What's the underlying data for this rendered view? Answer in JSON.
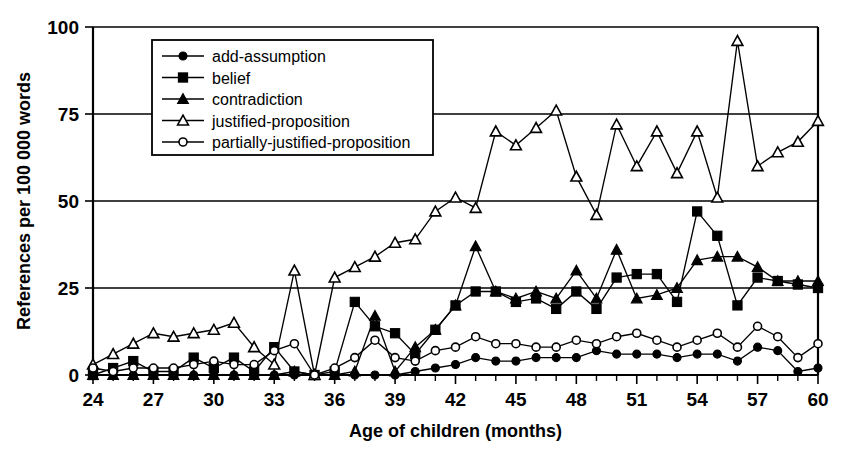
{
  "chart_data": {
    "type": "line",
    "title": "",
    "xlabel": "Age of children (months)",
    "ylabel": "References per 100 000 words",
    "xlim": [
      24,
      60
    ],
    "ylim": [
      0,
      100
    ],
    "yticks": [
      0,
      25,
      50,
      75,
      100
    ],
    "xticks": [
      24,
      27,
      30,
      33,
      36,
      39,
      42,
      45,
      48,
      51,
      54,
      57,
      60
    ],
    "xtick_labels": [
      "24",
      "27",
      "30",
      "33",
      "36",
      "39",
      "42",
      "45",
      "48",
      "51",
      "54",
      "57",
      "60"
    ],
    "ytick_labels": [
      "0",
      "25",
      "50",
      "75",
      "100"
    ],
    "x_minor_step": 1,
    "grid": "horizontal",
    "legend_position": "top-left-inside",
    "x": [
      24,
      25,
      26,
      27,
      28,
      29,
      30,
      31,
      32,
      33,
      34,
      35,
      36,
      37,
      38,
      39,
      40,
      41,
      42,
      43,
      44,
      45,
      46,
      47,
      48,
      49,
      50,
      51,
      52,
      53,
      54,
      55,
      56,
      57,
      58,
      59,
      60
    ],
    "series": [
      {
        "name": "add-assumption",
        "marker": "filled-circle",
        "values": [
          0,
          0,
          0,
          0,
          0,
          0,
          0,
          0,
          0,
          0,
          0,
          0,
          0,
          0,
          0,
          0,
          1,
          2,
          3,
          5,
          4,
          4,
          5,
          5,
          5,
          7,
          6,
          6,
          6,
          5,
          6,
          6,
          4,
          8,
          7,
          1,
          2
        ]
      },
      {
        "name": "belief",
        "marker": "filled-square",
        "values": [
          0,
          2,
          4,
          1,
          1,
          5,
          2,
          5,
          1,
          8,
          1,
          0,
          1,
          21,
          14,
          12,
          6,
          13,
          20,
          24,
          24,
          21,
          22,
          19,
          24,
          19,
          28,
          29,
          29,
          21,
          47,
          40,
          20,
          28,
          27,
          26,
          25
        ]
      },
      {
        "name": "contradiction",
        "marker": "filled-triangle",
        "values": [
          0,
          0,
          0,
          0,
          0,
          0,
          0,
          0,
          0,
          0,
          1,
          0,
          0,
          1,
          17,
          1,
          8,
          13,
          20,
          37,
          24,
          22,
          24,
          22,
          30,
          22,
          36,
          22,
          23,
          25,
          33,
          34,
          34,
          31,
          27,
          27,
          27
        ]
      },
      {
        "name": "justified-proposition",
        "marker": "open-triangle",
        "values": [
          3,
          6,
          9,
          12,
          11,
          12,
          13,
          15,
          8,
          3,
          30,
          0,
          28,
          31,
          34,
          38,
          39,
          47,
          51,
          48,
          70,
          66,
          71,
          76,
          57,
          46,
          72,
          60,
          70,
          58,
          70,
          51,
          96,
          60,
          64,
          67,
          73
        ]
      },
      {
        "name": "partially-justified-proposition",
        "marker": "open-circle",
        "values": [
          2,
          1,
          2,
          2,
          2,
          3,
          4,
          3,
          3,
          7,
          9,
          0,
          2,
          5,
          10,
          5,
          4,
          7,
          8,
          11,
          9,
          9,
          8,
          8,
          10,
          9,
          11,
          12,
          10,
          8,
          10,
          12,
          8,
          14,
          11,
          5,
          9
        ]
      }
    ]
  },
  "legend": {
    "items": [
      {
        "label": "add-assumption",
        "marker": "filled-circle"
      },
      {
        "label": "belief",
        "marker": "filled-square"
      },
      {
        "label": "contradiction",
        "marker": "filled-triangle"
      },
      {
        "label": "justified-proposition",
        "marker": "open-triangle"
      },
      {
        "label": "partially-justified-proposition",
        "marker": "open-circle"
      }
    ]
  }
}
